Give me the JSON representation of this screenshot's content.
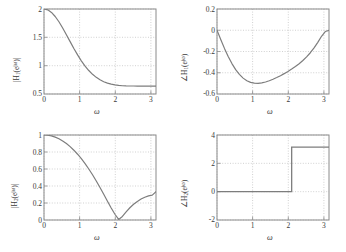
{
  "figure": {
    "width": 346,
    "height": 252,
    "background": "#ffffff",
    "curve_color": "#7d7d7d",
    "axis_color": "#8a8a8a",
    "grid_color": "#bdbdbd",
    "text_color": "#3a3a3a",
    "layout": "2x2 grid of frequency-response subplots"
  },
  "chart_data": [
    {
      "id": "top-left",
      "type": "line",
      "title": "",
      "xlabel": "ω",
      "ylabel": "|H₁(e^{jω})|",
      "ylabel_parts": {
        "prefix": "|H",
        "sub": "1",
        "mid": "(e",
        "sup": "jω",
        "suffix": ")|"
      },
      "xlim": [
        0,
        3.1416
      ],
      "ylim": [
        0.5,
        2
      ],
      "xticks": [
        0,
        1,
        2,
        3
      ],
      "xticklabels": [
        "0",
        "1",
        "2",
        "3"
      ],
      "yticks": [
        0.5,
        1,
        1.5,
        2
      ],
      "yticklabels": [
        "0.5",
        "1",
        "1.5",
        "2"
      ],
      "grid": true,
      "legend": false,
      "description": "Magnitude response of H1: monotonically decreasing from 2 at omega=0 to about 0.64 at omega=pi",
      "x": [
        0,
        0.1047,
        0.2094,
        0.3142,
        0.4189,
        0.5236,
        0.6283,
        0.733,
        0.8378,
        0.9425,
        1.0472,
        1.1519,
        1.2566,
        1.3614,
        1.4661,
        1.5708,
        1.6755,
        1.7802,
        1.885,
        1.9897,
        2.0944,
        2.1991,
        2.3038,
        2.4086,
        2.5133,
        2.618,
        2.7227,
        2.8274,
        2.9322,
        3.0369,
        3.1416
      ],
      "y": [
        2.0,
        1.9846,
        1.9394,
        1.8679,
        1.7748,
        1.6658,
        1.547,
        1.4245,
        1.3039,
        1.1898,
        1.0856,
        0.9934,
        0.9141,
        0.8477,
        0.7935,
        0.7503,
        0.7168,
        0.6915,
        0.673,
        0.6601,
        0.6514,
        0.646,
        0.643,
        0.6415,
        0.6409,
        0.6407,
        0.6406,
        0.6405,
        0.6404,
        0.6404,
        0.6404
      ]
    },
    {
      "id": "top-right",
      "type": "line",
      "title": "",
      "xlabel": "ω",
      "ylabel": "∠H₁(e^{jω})",
      "ylabel_parts": {
        "prefix": "∠H",
        "sub": "1",
        "mid": "(e",
        "sup": "jω",
        "suffix": ")"
      },
      "xlim": [
        0,
        3.1416
      ],
      "ylim": [
        -0.6,
        0.2
      ],
      "xticks": [
        0,
        1,
        2,
        3
      ],
      "xticklabels": [
        "0",
        "1",
        "2",
        "3"
      ],
      "yticks": [
        -0.6,
        -0.4,
        -0.2,
        0,
        0.2
      ],
      "yticklabels": [
        "-0.6",
        "-0.4",
        "-0.2",
        "0",
        "0.2"
      ],
      "grid": true,
      "legend": false,
      "description": "Phase response of H1: starts at 0, dips to minimum about -0.53 near omega=1, returns toward 0 at omega=pi",
      "x": [
        0,
        0.1047,
        0.2094,
        0.3142,
        0.4189,
        0.5236,
        0.6283,
        0.733,
        0.8378,
        0.9425,
        1.0472,
        1.1519,
        1.2566,
        1.3614,
        1.4661,
        1.5708,
        1.6755,
        1.7802,
        1.885,
        1.9897,
        2.0944,
        2.1991,
        2.3038,
        2.4086,
        2.5133,
        2.618,
        2.7227,
        2.8274,
        2.9322,
        3.0369,
        3.1416
      ],
      "y": [
        0.0,
        -0.0875,
        -0.1706,
        -0.2466,
        -0.3135,
        -0.37,
        -0.4157,
        -0.4505,
        -0.4752,
        -0.4907,
        -0.4983,
        -0.4994,
        -0.4952,
        -0.4869,
        -0.4754,
        -0.4614,
        -0.4454,
        -0.4277,
        -0.4085,
        -0.3878,
        -0.3655,
        -0.3413,
        -0.3146,
        -0.2848,
        -0.2508,
        -0.2116,
        -0.166,
        -0.1136,
        -0.0566,
        -0.0122,
        0.0
      ]
    },
    {
      "id": "bottom-left",
      "type": "line",
      "title": "",
      "xlabel": "ω",
      "ylabel": "|H₂(e^{jω})|",
      "ylabel_parts": {
        "prefix": "|H",
        "sub": "2",
        "mid": "(e",
        "sup": "jω",
        "suffix": ")|"
      },
      "xlim": [
        0,
        3.1416
      ],
      "ylim": [
        0,
        1
      ],
      "xticks": [
        0,
        1,
        2,
        3
      ],
      "xticklabels": [
        "0",
        "1",
        "2",
        "3"
      ],
      "yticks": [
        0,
        0.2,
        0.4,
        0.6,
        0.8,
        1
      ],
      "yticklabels": [
        "0",
        "0.2",
        "0.4",
        "0.6",
        "0.8",
        "1"
      ],
      "grid": true,
      "legend": false,
      "description": "Magnitude response of H2: starts at 1, decreases to a null (zero) at omega about 2.1, then rises to about 0.33 at omega=pi",
      "x": [
        0,
        0.1047,
        0.2094,
        0.3142,
        0.4189,
        0.5236,
        0.6283,
        0.733,
        0.8378,
        0.9425,
        1.0472,
        1.1519,
        1.2566,
        1.3614,
        1.4661,
        1.5708,
        1.6755,
        1.7802,
        1.885,
        1.9897,
        2.0944,
        2.1991,
        2.3038,
        2.4086,
        2.5133,
        2.618,
        2.7227,
        2.8274,
        2.9322,
        3.0369,
        3.1416
      ],
      "y": [
        1.0,
        0.9972,
        0.9889,
        0.9749,
        0.9553,
        0.9301,
        0.8993,
        0.8629,
        0.8211,
        0.7738,
        0.7211,
        0.6631,
        0.6,
        0.5318,
        0.4589,
        0.382,
        0.3021,
        0.2209,
        0.1412,
        0.0676,
        0.0066,
        0.0418,
        0.0964,
        0.144,
        0.1846,
        0.2185,
        0.2461,
        0.2676,
        0.2833,
        0.2931,
        0.3333
      ]
    },
    {
      "id": "bottom-right",
      "type": "line",
      "title": "",
      "xlabel": "ω",
      "ylabel": "∠H₂(e^{jω})",
      "ylabel_parts": {
        "prefix": "∠H",
        "sub": "2",
        "mid": "(e",
        "sup": "jω",
        "suffix": ")"
      },
      "xlim": [
        0,
        3.1416
      ],
      "ylim": [
        -2,
        4
      ],
      "xticks": [
        0,
        1,
        2,
        3
      ],
      "xticklabels": [
        "0",
        "1",
        "2",
        "3"
      ],
      "yticks": [
        -2,
        0,
        2,
        4
      ],
      "yticklabels": [
        "-2",
        "0",
        "2",
        "4"
      ],
      "grid": true,
      "legend": false,
      "description": "Phase response of H2: constant 0 until omega about 2.1, then jumps to pi (about 3.14) and stays constant to omega=pi",
      "x": [
        0,
        0.5,
        1.0,
        1.5,
        2.0,
        2.0944,
        2.0944,
        2.5,
        3.0,
        3.1416
      ],
      "y": [
        0,
        0,
        0,
        0,
        0,
        0,
        3.1416,
        3.1416,
        3.1416,
        3.1416
      ],
      "step_location": 2.0944,
      "step_from": 0,
      "step_to": 3.1416
    }
  ]
}
